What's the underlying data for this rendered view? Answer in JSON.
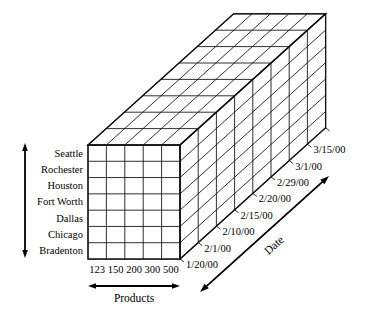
{
  "figure": {
    "type": "data-cube-diagram",
    "title": "",
    "background_color": "#ffffff",
    "line_color": "#1a1a1a"
  },
  "axes": {
    "rows": {
      "name": "location-axis",
      "title": "",
      "arrow": "double-vertical",
      "labels": [
        "Seattle",
        "Rochester",
        "Houston",
        "Fort Worth",
        "Dallas",
        "Chicago",
        "Bradenton"
      ]
    },
    "columns": {
      "name": "products-axis",
      "title": "Products",
      "arrow": "double-horizontal",
      "labels": [
        "123",
        "150",
        "200",
        "300",
        "500"
      ]
    },
    "depth": {
      "name": "date-axis",
      "title": "Date",
      "arrow": "double-diagonal",
      "labels": [
        "1/20/00",
        "2/1/00",
        "2/10/00",
        "2/15/00",
        "2/20/00",
        "2/29/00",
        "3/1/00",
        "3/15/00"
      ]
    }
  },
  "chart_data": {
    "type": "table",
    "dimensions": [
      "Location",
      "Products",
      "Date"
    ],
    "sizes": {
      "rows": 7,
      "columns": 5,
      "depth": 8
    },
    "row_categories": [
      "Seattle",
      "Rochester",
      "Houston",
      "Fort Worth",
      "Dallas",
      "Chicago",
      "Bradenton"
    ],
    "column_categories": [
      "123",
      "150",
      "200",
      "300",
      "500"
    ],
    "depth_categories": [
      "1/20/00",
      "2/1/00",
      "2/10/00",
      "2/15/00",
      "2/20/00",
      "2/29/00",
      "3/1/00",
      "3/15/00"
    ],
    "xlabel": "Products",
    "ylabel": "",
    "zlabel": "Date",
    "values": [],
    "grid": true,
    "legend": "none"
  },
  "geometry": {
    "front_left_x": 88,
    "front_top_y": 145,
    "front_right_x": 180,
    "front_bottom_y": 259,
    "depth_step_x": 18.2,
    "depth_step_y": -16.4
  }
}
